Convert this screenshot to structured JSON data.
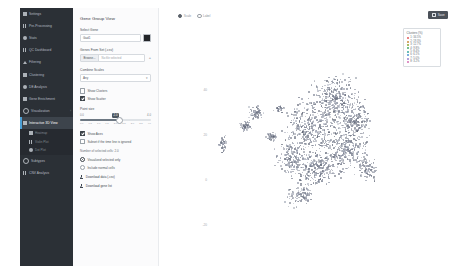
{
  "app": {
    "top_button": {
      "label": "Save",
      "icon": "save-icon"
    }
  },
  "sidebar": {
    "items": [
      {
        "label": "Settings",
        "icon": "gear-icon",
        "active": false,
        "sub": false
      },
      {
        "label": "Pre-Processing",
        "icon": "bars-icon",
        "active": false,
        "sub": false
      },
      {
        "label": "Stats",
        "icon": "user-icon",
        "active": false,
        "sub": false
      },
      {
        "label": "QC Dashboard",
        "icon": "chart-icon",
        "active": false,
        "sub": false
      },
      {
        "label": "Filtering",
        "icon": "filter-icon",
        "active": false,
        "sub": false
      },
      {
        "label": "Clustering",
        "icon": "grid-icon",
        "active": false,
        "sub": false
      },
      {
        "label": "DE Analysis",
        "icon": "dot-icon",
        "active": false,
        "sub": false
      },
      {
        "label": "Gene Enrichment",
        "icon": "flag-icon",
        "active": false,
        "sub": false
      },
      {
        "label": "Visualization",
        "icon": "eye-icon",
        "active": false,
        "sub": false,
        "caret": "›"
      },
      {
        "label": "Interactive 3D View",
        "icon": "cube-icon",
        "active": true,
        "sub": false
      },
      {
        "label": "Heatmap",
        "icon": "grid-icon",
        "active": false,
        "sub": true
      },
      {
        "label": "Violin Plot",
        "icon": "chart-icon",
        "active": false,
        "sub": true
      },
      {
        "label": "Dot Plot",
        "icon": "dot-icon",
        "active": false,
        "sub": true
      },
      {
        "label": "Subtypes",
        "icon": "ring-icon",
        "active": false,
        "sub": false
      },
      {
        "label": "CNV Analysis",
        "icon": "bars-icon",
        "active": false,
        "sub": false
      }
    ]
  },
  "panel": {
    "title": "Gene Group View",
    "select_gene": {
      "label": "Select Gene",
      "value": "Gad1",
      "color_swatch": "#222428"
    },
    "gene_set": {
      "label": "Genes From Set (.csv)",
      "browse_label": "Browse...",
      "file_value": "No file selected",
      "plus": "+"
    },
    "combine": {
      "label": "Combine Scales",
      "value": "Any",
      "chevron": "▾"
    },
    "checkbox_show_clusters": {
      "label": "Show Clusters",
      "checked": false
    },
    "checkbox_show_scatter": {
      "label": "Show Scatter",
      "checked": true
    },
    "point_size": {
      "label": "Point size",
      "min_label": "0.0",
      "current": "2.0",
      "max_label": "4.0",
      "ticks": [
        "0.0",
        "0.5",
        "1.0",
        "1.5",
        "2.0",
        "2.5",
        "3.0",
        "3.5",
        "4.0"
      ]
    },
    "checkbox_show_axes": {
      "label": "Show Axes",
      "checked": true
    },
    "checkbox_subset": {
      "label": "Subset if the time line is ignored",
      "checked": false
    },
    "count_note": "Number of selected cells: 2.0",
    "radio_selected_only": {
      "label": "Visualized selected only",
      "checked": true
    },
    "radio_normal": {
      "label": "Include normal cells",
      "checked": false
    },
    "download_data": {
      "label": "Download data (.csv)",
      "icon": "download-icon"
    },
    "download_list": {
      "label": "Download gene list",
      "icon": "download-icon"
    }
  },
  "plot": {
    "tools": [
      {
        "label": "Scale",
        "on": true
      },
      {
        "label": "Label",
        "on": false
      }
    ],
    "legend": {
      "title": "Clusters (%)",
      "items": [
        {
          "label": "1: 34.5%",
          "color": "#e05a5a"
        },
        {
          "label": "2: 19.3%",
          "color": "#c98a3c"
        },
        {
          "label": "3: 12.7%",
          "color": "#8fa832"
        },
        {
          "label": "4: 9.8%",
          "color": "#46ab6b"
        },
        {
          "label": "5: 8.4%",
          "color": "#38a7a0"
        },
        {
          "label": "6: 6.1%",
          "color": "#4d96d4"
        },
        {
          "label": "7: 5.0%",
          "color": "#9a7fd1"
        },
        {
          "label": "8: 3.2%",
          "color": "#d36fb3"
        }
      ]
    },
    "y_ticks": [
      "40",
      "20",
      "0",
      "-20"
    ]
  }
}
